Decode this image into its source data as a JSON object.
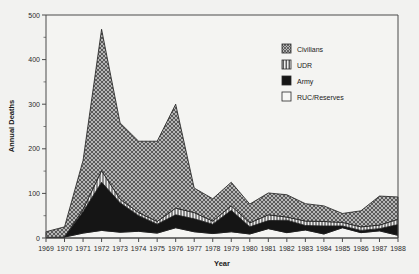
{
  "figure": {
    "background_color": "#f2f2f0",
    "frame_color": "#4a4a4a"
  },
  "axes": {
    "ylabel": "Annual Deaths",
    "xlabel": "Year",
    "y_ticks": [
      "0",
      "100",
      "200",
      "300",
      "400",
      "500"
    ],
    "x_ticks": [
      "1969",
      "1970",
      "1971",
      "1972",
      "1973",
      "1974",
      "1975",
      "1976",
      "1977",
      "1978",
      "1979",
      "1980",
      "1981",
      "1982",
      "1983",
      "1984",
      "1985",
      "1986",
      "1987",
      "1988"
    ]
  },
  "legend": {
    "items": [
      {
        "label": "Civilians",
        "pattern": "cross-hatch",
        "color": "#8c8c8c"
      },
      {
        "label": "UDR",
        "pattern": "vertical-lines",
        "color": "#d8d8d8"
      },
      {
        "label": "Army",
        "pattern": "solid",
        "color": "#151515"
      },
      {
        "label": "RUC/Reserves",
        "pattern": "blank",
        "color": "#f4f4f2"
      }
    ]
  },
  "chart_data": {
    "type": "area",
    "stacked": true,
    "title": "",
    "xlabel": "Year",
    "ylabel": "Annual Deaths",
    "xlim": [
      1969,
      1988
    ],
    "ylim": [
      0,
      500
    ],
    "grid": false,
    "legend_position": "upper right",
    "x": [
      1969,
      1970,
      1971,
      1972,
      1973,
      1974,
      1975,
      1976,
      1977,
      1978,
      1979,
      1980,
      1981,
      1982,
      1983,
      1984,
      1985,
      1986,
      1987,
      1988
    ],
    "categories": [
      "1969",
      "1970",
      "1971",
      "1972",
      "1973",
      "1974",
      "1975",
      "1976",
      "1977",
      "1978",
      "1979",
      "1980",
      "1981",
      "1982",
      "1983",
      "1984",
      "1985",
      "1986",
      "1987",
      "1988"
    ],
    "series": [
      {
        "name": "RUC/Reserves",
        "values": [
          1,
          2,
          11,
          17,
          13,
          15,
          11,
          23,
          14,
          10,
          14,
          9,
          21,
          12,
          18,
          9,
          23,
          12,
          16,
          6
        ],
        "pattern": "blank",
        "color": "#f4f4f2"
      },
      {
        "name": "Army",
        "values": [
          0,
          0,
          48,
          108,
          66,
          35,
          20,
          29,
          29,
          21,
          48,
          16,
          18,
          28,
          10,
          18,
          4,
          5,
          5,
          24
        ],
        "pattern": "solid",
        "color": "#151515"
      },
      {
        "name": "UDR",
        "values": [
          0,
          0,
          5,
          26,
          8,
          7,
          6,
          15,
          14,
          7,
          10,
          9,
          13,
          7,
          10,
          10,
          8,
          8,
          8,
          12
        ],
        "pattern": "vertical-lines",
        "color": "#d8d8d8"
      },
      {
        "name": "Civilians",
        "values": [
          13,
          23,
          110,
          317,
          171,
          160,
          180,
          233,
          55,
          50,
          53,
          42,
          49,
          50,
          39,
          35,
          20,
          36,
          65,
          50
        ],
        "pattern": "cross-hatch",
        "color": "#8c8c8c"
      }
    ],
    "totals": [
      14,
      25,
      174,
      468,
      258,
      217,
      217,
      300,
      112,
      88,
      125,
      76,
      101,
      97,
      77,
      72,
      55,
      61,
      94,
      92
    ],
    "annotations": {
      "peak_year": "1972",
      "peak_value": 468,
      "secondary_peak_year": "1976",
      "secondary_peak_value": 300
    }
  }
}
